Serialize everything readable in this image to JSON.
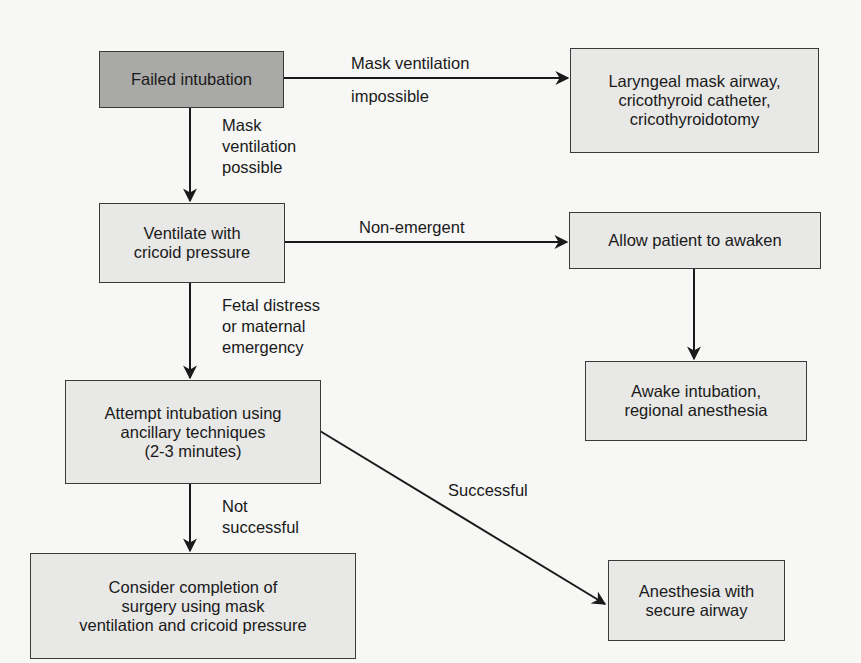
{
  "diagram": {
    "type": "flowchart",
    "colors": {
      "start_node": "#a9a9a7",
      "node": "#e8e8e6",
      "border": "#3a3a3a",
      "background": "#f7f7f5"
    },
    "nodes": {
      "failed": {
        "lines": [
          "Failed intubation"
        ]
      },
      "lma": {
        "lines": [
          "Laryngeal mask airway,",
          "cricothyroid catheter,",
          "cricothyroidotomy"
        ]
      },
      "ventilate": {
        "lines": [
          "Ventilate with",
          "cricoid pressure"
        ]
      },
      "awaken": {
        "lines": [
          "Allow patient to awaken"
        ]
      },
      "awake_int": {
        "lines": [
          "Awake intubation,",
          "regional anesthesia"
        ]
      },
      "attempt": {
        "lines": [
          "Attempt intubation using",
          "ancillary techniques",
          "(2-3 minutes)"
        ]
      },
      "consider": {
        "lines": [
          "Consider completion of",
          "surgery using mask",
          "ventilation and cricoid pressure"
        ]
      },
      "secure": {
        "lines": [
          "Anesthesia with",
          "secure airway"
        ]
      }
    },
    "edges": {
      "failed_lma": {
        "from": "failed",
        "to": "lma",
        "lines": [
          "Mask ventilation",
          "impossible"
        ]
      },
      "failed_ventilate": {
        "from": "failed",
        "to": "ventilate",
        "lines": [
          "Mask",
          "ventilation",
          "possible"
        ]
      },
      "ventilate_awaken": {
        "from": "ventilate",
        "to": "awaken",
        "lines": [
          "Non-emergent"
        ]
      },
      "ventilate_attempt": {
        "from": "ventilate",
        "to": "attempt",
        "lines": [
          "Fetal distress",
          "or maternal",
          "emergency"
        ]
      },
      "awaken_awake_int": {
        "from": "awaken",
        "to": "awake_int",
        "lines": []
      },
      "attempt_consider": {
        "from": "attempt",
        "to": "consider",
        "lines": [
          "Not",
          "successful"
        ]
      },
      "attempt_secure": {
        "from": "attempt",
        "to": "secure",
        "lines": [
          "Successful"
        ]
      }
    }
  }
}
